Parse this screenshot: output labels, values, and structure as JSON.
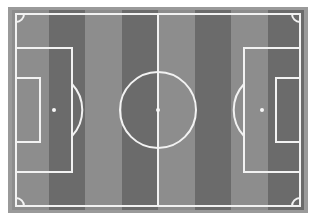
{
  "diagram": {
    "orientation": "landscape",
    "view": "plan-view-top-down"
  },
  "canvas": {
    "width": 316,
    "height": 221,
    "background_color": "#ffffff"
  },
  "surround": {
    "name": "pitch-surround-mat",
    "color": "#9a9a9a",
    "x": 8,
    "y": 7,
    "width": 300,
    "height": 206
  },
  "turf": {
    "x": 12,
    "y": 10,
    "width": 292,
    "height": 200,
    "stripe_count": 8,
    "stripe_width": 36.5,
    "light_color": "#8d8d8d",
    "dark_color": "#6b6b6b",
    "stripes": [
      {
        "index": 0,
        "x": 0,
        "width": 36.5,
        "color": "#8d8d8d",
        "tone": "light"
      },
      {
        "index": 1,
        "x": 36.5,
        "width": 36.5,
        "color": "#6b6b6b",
        "tone": "dark"
      },
      {
        "index": 2,
        "x": 73,
        "width": 36.5,
        "color": "#8d8d8d",
        "tone": "light"
      },
      {
        "index": 3,
        "x": 109.5,
        "width": 36.5,
        "color": "#6b6b6b",
        "tone": "dark"
      },
      {
        "index": 4,
        "x": 146,
        "width": 36.5,
        "color": "#8d8d8d",
        "tone": "light"
      },
      {
        "index": 5,
        "x": 182.5,
        "width": 36.5,
        "color": "#6b6b6b",
        "tone": "dark"
      },
      {
        "index": 6,
        "x": 219,
        "width": 36.5,
        "color": "#8d8d8d",
        "tone": "light"
      },
      {
        "index": 7,
        "x": 255.5,
        "width": 36.5,
        "color": "#6b6b6b",
        "tone": "dark"
      }
    ]
  },
  "markings": {
    "line_color": "#f2f2f2",
    "line_width": 2,
    "touchline_boundary": {
      "x": 4,
      "y": 4,
      "width": 284,
      "height": 192
    },
    "halfway_line": {
      "x1": 146,
      "y1": 4,
      "x2": 146,
      "y2": 196
    },
    "center_circle": {
      "cx": 146,
      "cy": 100,
      "r": 38
    },
    "center_spot": {
      "cx": 146,
      "cy": 100,
      "r": 2
    },
    "penalty_area_left": {
      "x": 4,
      "y": 38,
      "width": 56,
      "height": 124
    },
    "penalty_area_right": {
      "x": 232,
      "y": 38,
      "width": 56,
      "height": 124
    },
    "goal_area_left": {
      "x": 4,
      "y": 68,
      "width": 24,
      "height": 64
    },
    "goal_area_right": {
      "x": 264,
      "y": 68,
      "width": 24,
      "height": 64
    },
    "penalty_spot_left": {
      "cx": 42,
      "cy": 100,
      "r": 2
    },
    "penalty_spot_right": {
      "cx": 250,
      "cy": 100,
      "r": 2
    },
    "penalty_arc_left": "M 60 74 A 38 38 0 0 1 60 126",
    "penalty_arc_right": "M 232 74 A 38 38 0 0 0 232 126",
    "corner_arc_radius": 8,
    "corner_arc_top_left": "M 4 12 A 8 8 0 0 0 12 4",
    "corner_arc_top_right": "M 280 4 A 8 8 0 0 0 288 12",
    "corner_arc_bottom_left": "M 12 196 A 8 8 0 0 0 4 188",
    "corner_arc_bottom_right": "M 288 188 A 8 8 0 0 0 280 196"
  }
}
